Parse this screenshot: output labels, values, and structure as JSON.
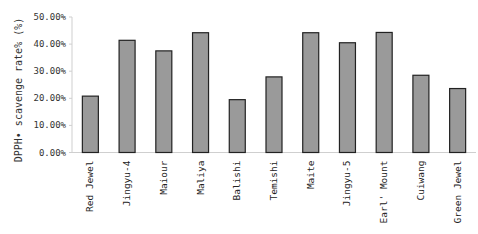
{
  "chart_data": {
    "type": "bar",
    "title": "",
    "xlabel": "",
    "ylabel": "DPPH• scavenge rate% (%)",
    "ylim": [
      0,
      50
    ],
    "yticks": [
      "0.00%",
      "10.00%",
      "20.00%",
      "30.00%",
      "40.00%",
      "50.00%"
    ],
    "ytick_values": [
      0,
      10,
      20,
      30,
      40,
      50
    ],
    "grid": false,
    "legend": "none",
    "categories": [
      "Red Jewel",
      "Jingyu-4",
      "Maiour",
      "Maliya",
      "Balishi",
      "Temishi",
      "Maite",
      "Jingyu-5",
      "Earl' Mount",
      "Cuiwang",
      "Green Jewel"
    ],
    "values": [
      20.8,
      41.4,
      37.5,
      44.2,
      19.5,
      27.9,
      44.2,
      40.5,
      44.3,
      28.5,
      23.6
    ],
    "colors": {
      "bar_fill": "#9a9a9a",
      "bar_stroke": "#222222",
      "axis": "#cccccc"
    }
  }
}
